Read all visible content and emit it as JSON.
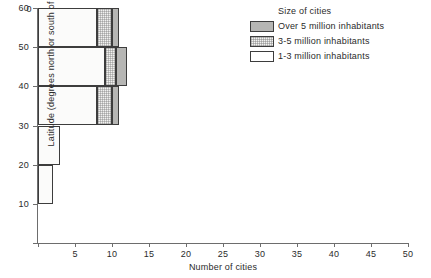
{
  "chart_data": {
    "type": "bar",
    "orientation": "horizontal",
    "stacked": true,
    "title": "",
    "xlabel": "Number of cities",
    "ylabel": "Latitude (degrees north or south of equator)",
    "xlim": [
      0,
      50
    ],
    "ylim": [
      0,
      60
    ],
    "xticks": [
      0,
      5,
      10,
      15,
      20,
      25,
      30,
      35,
      40,
      45,
      50
    ],
    "yticks": [
      0,
      10,
      20,
      30,
      40,
      50,
      60
    ],
    "grid": false,
    "legend_position": "top-right",
    "legend_title": "Size of cities",
    "categories": [
      "0-10",
      "10-20",
      "20-30",
      "30-40",
      "40-50",
      "50-60"
    ],
    "series": [
      {
        "name": "1-3 million inhabitants",
        "key": "size-1-3",
        "values": [
          0,
          2,
          3,
          8,
          9,
          8
        ]
      },
      {
        "name": "3-5 million inhabitants",
        "key": "size-3-5",
        "values": [
          0,
          0,
          0,
          2,
          1.5,
          2
        ]
      },
      {
        "name": "Over 5 million inhabitants",
        "key": "size-over-5",
        "values": [
          0,
          0,
          0,
          1,
          1.5,
          1
        ]
      }
    ],
    "bands": [
      {
        "lat_low": 0,
        "lat_high": 10,
        "segments": []
      },
      {
        "lat_low": 10,
        "lat_high": 20,
        "segments": [
          {
            "series": "1-3 million inhabitants",
            "key": "size-1-3",
            "start": 0,
            "end": 2
          }
        ]
      },
      {
        "lat_low": 20,
        "lat_high": 30,
        "segments": [
          {
            "series": "1-3 million inhabitants",
            "key": "size-1-3",
            "start": 0,
            "end": 3
          }
        ]
      },
      {
        "lat_low": 30,
        "lat_high": 40,
        "segments": [
          {
            "series": "1-3 million inhabitants",
            "key": "size-1-3",
            "start": 0,
            "end": 8
          },
          {
            "series": "3-5 million inhabitants",
            "key": "size-3-5",
            "start": 8,
            "end": 10
          },
          {
            "series": "Over 5 million inhabitants",
            "key": "size-over-5",
            "start": 10,
            "end": 11
          }
        ]
      },
      {
        "lat_low": 40,
        "lat_high": 50,
        "segments": [
          {
            "series": "1-3 million inhabitants",
            "key": "size-1-3",
            "start": 0,
            "end": 9
          },
          {
            "series": "3-5 million inhabitants",
            "key": "size-3-5",
            "start": 9,
            "end": 10.5
          },
          {
            "series": "Over 5 million inhabitants",
            "key": "size-over-5",
            "start": 10.5,
            "end": 12
          }
        ]
      },
      {
        "lat_low": 50,
        "lat_high": 60,
        "segments": [
          {
            "series": "1-3 million inhabitants",
            "key": "size-1-3",
            "start": 0,
            "end": 8
          },
          {
            "series": "3-5 million inhabitants",
            "key": "size-3-5",
            "start": 8,
            "end": 10
          },
          {
            "series": "Over 5 million inhabitants",
            "key": "size-over-5",
            "start": 10,
            "end": 11
          }
        ]
      }
    ],
    "colors": {
      "size-1-3": "#fbfbfa",
      "size-3-5": "#f2f2f0",
      "size-over-5": "#b6b6b4",
      "outline": "#3d3d3d",
      "axis": "#6d6d6d",
      "text": "#2b2b2b",
      "background": "#ffffff"
    }
  },
  "axes": {
    "x": {
      "title": "Number of cities",
      "tick_labels": [
        "0",
        "5",
        "10",
        "15",
        "20",
        "25",
        "30",
        "35",
        "40",
        "45",
        "50"
      ]
    },
    "y": {
      "title": "Latitude (degrees north or south of equator)",
      "tick_labels": [
        "0",
        "10",
        "20",
        "30",
        "40",
        "50",
        "60"
      ]
    }
  },
  "legend": {
    "title": "Size of cities",
    "items": [
      {
        "label": "Over 5 million inhabitants",
        "key": "size-over-5"
      },
      {
        "label": "3-5 million inhabitants",
        "key": "size-3-5"
      },
      {
        "label": "1-3 million inhabitants",
        "key": "size-1-3"
      }
    ]
  }
}
